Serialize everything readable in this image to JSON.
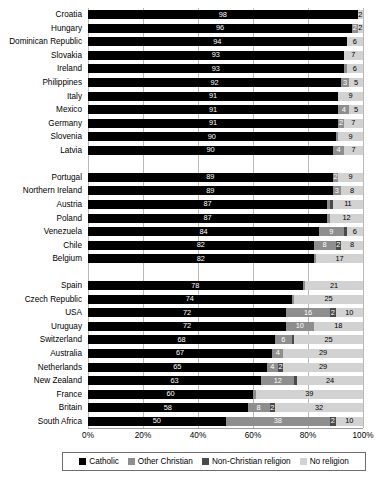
{
  "chart_data": {
    "type": "bar",
    "orientation": "horizontal",
    "stacked": true,
    "title": "",
    "xlabel": "",
    "ylabel": "",
    "xlim": [
      0,
      100
    ],
    "grid": true,
    "legend_position": "bottom",
    "xticks": [
      "0%",
      "20%",
      "40%",
      "60%",
      "80%",
      "100%"
    ],
    "xtick_values": [
      0,
      20,
      40,
      60,
      80,
      100
    ],
    "series": [
      {
        "name": "Catholic",
        "color": "#000000"
      },
      {
        "name": "Other Christian",
        "color": "#8e8e8e"
      },
      {
        "name": "Non-Christian religion",
        "color": "#4a4a4a"
      },
      {
        "name": "No religion",
        "color": "#d2d2d2"
      }
    ],
    "categories": [
      "Croatia",
      "Hungary",
      "Dominican Republic",
      "Slovakia",
      "Ireland",
      "Philippines",
      "Italy",
      "Mexico",
      "Germany",
      "Slovenia",
      "Latvia",
      "",
      "Portugal",
      "Northern Ireland",
      "Austria",
      "Poland",
      "Venezuela",
      "Chile",
      "Belgium",
      "",
      "Spain",
      "Czech Republic",
      "USA",
      "Uruguay",
      "Switzerland",
      "Australia",
      "Netherlands",
      "New Zealand",
      "France",
      "Britain",
      "South Africa"
    ],
    "rows": [
      {
        "category": "Croatia",
        "values": [
          98,
          0,
          0,
          2
        ],
        "labels": [
          "98",
          "",
          "",
          "2"
        ]
      },
      {
        "category": "Hungary",
        "values": [
          96,
          2,
          0,
          2
        ],
        "labels": [
          "96",
          "2",
          "",
          "2"
        ]
      },
      {
        "category": "Dominican Republic",
        "values": [
          94,
          0,
          0,
          6
        ],
        "labels": [
          "94",
          "",
          "",
          "6"
        ]
      },
      {
        "category": "Slovakia",
        "values": [
          93,
          0,
          0,
          7
        ],
        "labels": [
          "93",
          "",
          "",
          "7"
        ]
      },
      {
        "category": "Ireland",
        "values": [
          93,
          1,
          0,
          6
        ],
        "labels": [
          "93",
          "",
          "",
          "6"
        ]
      },
      {
        "category": "Philippines",
        "values": [
          92,
          3,
          0,
          5
        ],
        "labels": [
          "92",
          "3",
          "",
          "5"
        ]
      },
      {
        "category": "Italy",
        "values": [
          91,
          0,
          0,
          9
        ],
        "labels": [
          "91",
          "",
          "",
          "9"
        ]
      },
      {
        "category": "Mexico",
        "values": [
          91,
          4,
          0,
          5
        ],
        "labels": [
          "91",
          "4",
          "",
          "5"
        ]
      },
      {
        "category": "Germany",
        "values": [
          91,
          2,
          0,
          7
        ],
        "labels": [
          "91",
          "2",
          "",
          "7"
        ]
      },
      {
        "category": "Slovenia",
        "values": [
          90,
          1,
          0,
          9
        ],
        "labels": [
          "90",
          "",
          "",
          "9"
        ]
      },
      {
        "category": "Latvia",
        "values": [
          90,
          4,
          0,
          7
        ],
        "labels": [
          "90",
          "4",
          "",
          "7"
        ]
      },
      {
        "category": "",
        "values": [
          0,
          0,
          0,
          0
        ],
        "labels": [
          "",
          "",
          "",
          ""
        ]
      },
      {
        "category": "Portugal",
        "values": [
          89,
          2,
          0,
          9
        ],
        "labels": [
          "89",
          "2",
          "",
          "9"
        ]
      },
      {
        "category": "Northern Ireland",
        "values": [
          89,
          3,
          0,
          8
        ],
        "labels": [
          "89",
          "3",
          "",
          "8"
        ]
      },
      {
        "category": "Austria",
        "values": [
          87,
          1,
          1,
          11
        ],
        "labels": [
          "87",
          "",
          "",
          "11"
        ]
      },
      {
        "category": "Poland",
        "values": [
          87,
          1,
          0,
          12
        ],
        "labels": [
          "87",
          "",
          "",
          "12"
        ]
      },
      {
        "category": "Venezuela",
        "values": [
          84,
          9,
          1,
          6
        ],
        "labels": [
          "84",
          "9",
          "",
          "6"
        ]
      },
      {
        "category": "Chile",
        "values": [
          82,
          8,
          2,
          8
        ],
        "labels": [
          "82",
          "8",
          "2",
          "8"
        ]
      },
      {
        "category": "Belgium",
        "values": [
          82,
          1,
          0,
          17
        ],
        "labels": [
          "82",
          "",
          "",
          "17"
        ]
      },
      {
        "category": "",
        "values": [
          0,
          0,
          0,
          0
        ],
        "labels": [
          "",
          "",
          "",
          ""
        ]
      },
      {
        "category": "Spain",
        "values": [
          78,
          1,
          0,
          21
        ],
        "labels": [
          "78",
          "",
          "",
          "21"
        ]
      },
      {
        "category": "Czech Republic",
        "values": [
          74,
          1,
          0,
          25
        ],
        "labels": [
          "74",
          "",
          "",
          "25"
        ]
      },
      {
        "category": "USA",
        "values": [
          72,
          16,
          2,
          10
        ],
        "labels": [
          "72",
          "16",
          "2",
          "10"
        ]
      },
      {
        "category": "Uruguay",
        "values": [
          72,
          10,
          0,
          18
        ],
        "labels": [
          "72",
          "10",
          "",
          "18"
        ]
      },
      {
        "category": "Switzerland",
        "values": [
          68,
          6,
          1,
          25
        ],
        "labels": [
          "68",
          "6",
          "",
          "25"
        ]
      },
      {
        "category": "Australia",
        "values": [
          67,
          4,
          0,
          29
        ],
        "labels": [
          "67",
          "4",
          "",
          "29"
        ]
      },
      {
        "category": "Netherlands",
        "values": [
          65,
          4,
          2,
          29
        ],
        "labels": [
          "65",
          "4",
          "2",
          "29"
        ]
      },
      {
        "category": "New Zealand",
        "values": [
          63,
          12,
          1,
          24
        ],
        "labels": [
          "63",
          "12",
          "",
          "24"
        ]
      },
      {
        "category": "France",
        "values": [
          60,
          1,
          0,
          39
        ],
        "labels": [
          "60",
          "",
          "",
          "39"
        ]
      },
      {
        "category": "Britain",
        "values": [
          58,
          8,
          2,
          32
        ],
        "labels": [
          "58",
          "8",
          "2",
          "32"
        ]
      },
      {
        "category": "South Africa",
        "values": [
          50,
          38,
          2,
          10
        ],
        "labels": [
          "50",
          "38",
          "2",
          "10"
        ]
      }
    ]
  }
}
